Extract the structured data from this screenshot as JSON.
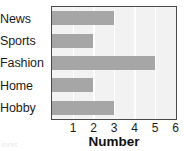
{
  "chart_data": {
    "type": "bar",
    "orientation": "horizontal",
    "title": "",
    "subtitle": "",
    "xlabel": "Number",
    "ylabel": "",
    "categories": [
      "News",
      "Sports",
      "Fashion",
      "Home",
      "Hobby"
    ],
    "values": [
      3,
      2,
      5,
      2,
      3
    ],
    "xlim": [
      0,
      6
    ],
    "xticks": [
      1,
      2,
      3,
      4,
      5,
      6
    ],
    "xtick_labels": [
      "1",
      "2",
      "3",
      "4",
      "5",
      "6"
    ],
    "grid": true,
    "grid_axis": "x",
    "legend": false,
    "legend_position": "none",
    "bar_color": "#a6a6a6",
    "plot_background": "#f2f2f2",
    "gridline_color": "#ffffff",
    "axis_border_color": "#4a4a4a",
    "text_color": "#1c1c1c"
  },
  "figure": {
    "axis_title_bold": true,
    "corner_fragment": "ings"
  }
}
